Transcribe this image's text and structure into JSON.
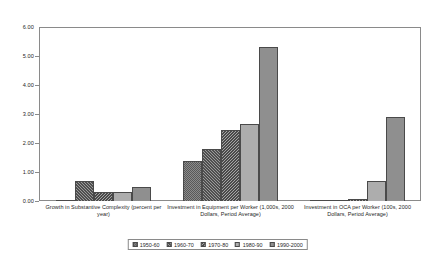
{
  "chart_data": {
    "type": "bar",
    "title": "",
    "subtitle": "",
    "xlabel": "",
    "ylabel": "",
    "ylim": [
      0,
      6
    ],
    "ytick_labels": [
      "0.00",
      "1.00",
      "2.00",
      "3.00",
      "4.00",
      "5.00",
      "6.00"
    ],
    "ytick_values": [
      0,
      1,
      2,
      3,
      4,
      5,
      6
    ],
    "grid": false,
    "legend_position": "bottom",
    "categories": [
      "Growth in Substantive Complexity (percent per year)",
      "Investment in Equipment per Worker (1,000s, 2000 Dollars, Period Average)",
      "Investment in OCA per Worker (100s, 2000 Dollars, Period Average)"
    ],
    "series": [
      {
        "name": "1950-60",
        "values": [
          0.03,
          1.38,
          0.02
        ]
      },
      {
        "name": "1960-70",
        "values": [
          0.68,
          1.78,
          0.04
        ]
      },
      {
        "name": "1970-80",
        "values": [
          0.32,
          2.45,
          0.08
        ]
      },
      {
        "name": "1980-90",
        "values": [
          0.3,
          2.65,
          0.7
        ]
      },
      {
        "name": "1990-2000",
        "values": [
          0.5,
          5.3,
          2.9
        ]
      }
    ]
  },
  "legend": {
    "items": [
      {
        "label": "1950-60"
      },
      {
        "label": "1960-70"
      },
      {
        "label": "1970-80"
      },
      {
        "label": "1980-90"
      },
      {
        "label": "1990-2000"
      }
    ]
  }
}
